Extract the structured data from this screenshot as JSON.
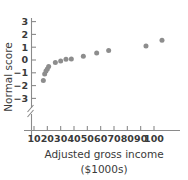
{
  "chart_data": {
    "type": "scatter",
    "title": "",
    "xlabel": "Adjusted gross income",
    "xlabel_units": "($1000s)",
    "ylabel": "Normal score",
    "x": [
      17,
      18,
      19,
      20,
      21,
      26,
      30,
      34,
      38,
      47,
      57,
      66,
      94,
      106
    ],
    "y": [
      -1.6,
      -1.1,
      -0.85,
      -0.7,
      -0.5,
      -0.2,
      -0.08,
      0.05,
      0.08,
      0.3,
      0.55,
      0.75,
      1.1,
      1.55
    ],
    "points": [
      {
        "x": 17,
        "y": -1.6
      },
      {
        "x": 18,
        "y": -1.1
      },
      {
        "x": 19,
        "y": -0.85
      },
      {
        "x": 20,
        "y": -0.7
      },
      {
        "x": 21,
        "y": -0.5
      },
      {
        "x": 26,
        "y": -0.2
      },
      {
        "x": 30,
        "y": -0.08
      },
      {
        "x": 34,
        "y": 0.05
      },
      {
        "x": 38,
        "y": 0.08
      },
      {
        "x": 47,
        "y": 0.3
      },
      {
        "x": 57,
        "y": 0.55
      },
      {
        "x": 66,
        "y": 0.75
      },
      {
        "x": 94,
        "y": 1.1
      },
      {
        "x": 106,
        "y": 1.55
      }
    ],
    "xticks": [
      10,
      20,
      30,
      40,
      50,
      60,
      70,
      80,
      90,
      100
    ],
    "xtick_labels": [
      "10",
      "20",
      "30",
      "40",
      "50",
      "60",
      "70",
      "80",
      "90",
      "100"
    ],
    "yticks": [
      -3,
      -2,
      -1,
      0,
      1,
      2,
      3
    ],
    "ytick_labels": [
      "−3",
      "−2",
      "−1",
      "0",
      "1",
      "2",
      "3"
    ],
    "xlim": [
      5,
      110
    ],
    "ylim": [
      -3,
      3
    ],
    "grid": false,
    "legend": false,
    "axis_break_y": true,
    "marker_color": "#8d8d8d",
    "axis_color": "#8a8a8a",
    "text_color": "#3a3a3a",
    "background": "#ffffff"
  },
  "figure": {
    "top_cropped_text": ""
  }
}
